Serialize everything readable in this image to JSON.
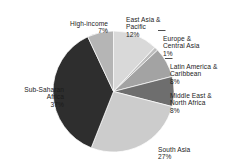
{
  "chart_data": {
    "type": "pie",
    "title": "",
    "subtitle": "",
    "xlabel": "",
    "ylabel": "",
    "legend_position": "none",
    "grid": false,
    "start_angle_deg": 0,
    "direction": "clockwise",
    "units": "percent",
    "categories": [
      "East Asia & Pacific",
      "Europe & Central Asia",
      "Latin America & Caribbean",
      "Middle East & North Africa",
      "South Asia",
      "Sub-Saharan Africa",
      "High-income"
    ],
    "values": [
      12,
      1,
      8,
      8,
      27,
      37,
      7
    ],
    "slices": [
      {
        "label": "East Asia & Pacific",
        "value": 12,
        "value_text": "12%",
        "color": "#d9d9d9"
      },
      {
        "label": "Europe & Central Asia",
        "value": 1,
        "value_text": "1%",
        "color": "#bdbdbd"
      },
      {
        "label": "Latin America & Caribbean",
        "value": 8,
        "value_text": "8%",
        "color": "#a3a3a3"
      },
      {
        "label": "Middle East & North Africa",
        "value": 8,
        "value_text": "8%",
        "color": "#6e6e6e"
      },
      {
        "label": "South Asia",
        "value": 27,
        "value_text": "27%",
        "color": "#cccccc"
      },
      {
        "label": "Sub-Saharan Africa",
        "value": 37,
        "value_text": "37%",
        "color": "#2e2e2e"
      },
      {
        "label": "High-income",
        "value": 7,
        "value_text": "7%",
        "color": "#b5b5b5"
      }
    ]
  },
  "labels": {
    "high_income": {
      "name": "High-income",
      "pct": "7%"
    },
    "east_asia": {
      "name": "East Asia &\nPacific",
      "pct": "12%"
    },
    "europe": {
      "name": "Europe &\nCentral Asia",
      "pct": "1%"
    },
    "latin": {
      "name": "Latin America &\nCaribbean",
      "pct": "8%"
    },
    "mena": {
      "name": "Middle East &\nNorth Africa",
      "pct": "8%"
    },
    "south_asia": {
      "name": "South Asia",
      "pct": "27%"
    },
    "ssa": {
      "name": "Sub-Saharan\nAfrica",
      "pct": "37%"
    }
  },
  "colors": {
    "background": "#ffffff",
    "text": "#1b1b1b",
    "leader_line": "#3a3a3a",
    "slice_outline": "#ffffff"
  }
}
